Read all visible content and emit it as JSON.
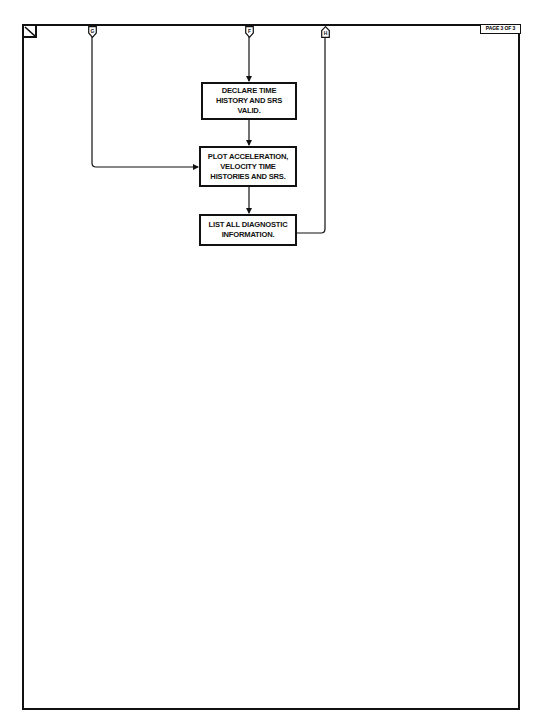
{
  "page": {
    "page_label": "PAGE 3 OF 3"
  },
  "connectors": [
    {
      "id": "G",
      "label": "G",
      "direction": "in"
    },
    {
      "id": "F",
      "label": "F",
      "direction": "in"
    },
    {
      "id": "H",
      "label": "H",
      "direction": "out"
    }
  ],
  "steps": [
    {
      "id": "declare",
      "text": "DECLARE TIME HISTORY AND SRS VALID."
    },
    {
      "id": "plot",
      "text": "PLOT ACCELERATION, VELOCITY TIME HISTORIES AND SRS."
    },
    {
      "id": "list",
      "text": "LIST ALL DIAGNOSTIC INFORMATION."
    }
  ],
  "colors": {
    "line": "#111111",
    "background": "#ffffff"
  }
}
